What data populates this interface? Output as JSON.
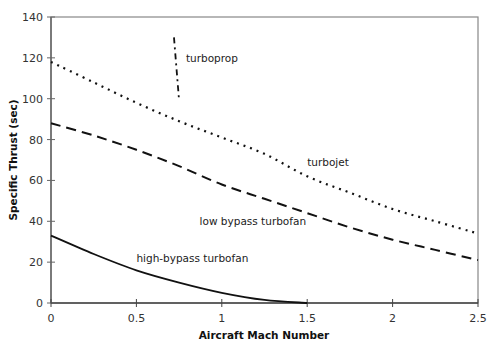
{
  "chart_data": {
    "type": "line",
    "title": "",
    "xlabel": "Aircraft Mach Number",
    "ylabel": "Specific Thrust (sec)",
    "xlim": [
      0,
      2.5
    ],
    "ylim": [
      0,
      140
    ],
    "xticks": [
      0,
      0.5,
      1,
      1.5,
      2,
      2.5
    ],
    "xtick_labels": [
      "0",
      "0.5",
      "1",
      "1.5",
      "2",
      "2.5"
    ],
    "yticks": [
      0,
      20,
      40,
      60,
      80,
      100,
      120,
      140
    ],
    "ytick_labels": [
      "0",
      "20",
      "40",
      "60",
      "80",
      "100",
      "120",
      "140"
    ],
    "grid": false,
    "legend": "none (inline labels)",
    "series": [
      {
        "name": "turboprop",
        "style": "dash-dot",
        "x": [
          0.72,
          0.75
        ],
        "y": [
          130,
          99
        ],
        "label_pos": [
          0.79,
          118
        ]
      },
      {
        "name": "turbojet",
        "style": "dotted",
        "x": [
          0,
          0.25,
          0.5,
          0.75,
          1.0,
          1.25,
          1.5,
          1.75,
          2.0,
          2.25,
          2.5
        ],
        "y": [
          118,
          108,
          98,
          89,
          81,
          73,
          62,
          54,
          46,
          40,
          34
        ],
        "label_pos": [
          1.5,
          67
        ]
      },
      {
        "name": "low bypass turbofan",
        "style": "dashed",
        "x": [
          0,
          0.25,
          0.5,
          0.75,
          1.0,
          1.25,
          1.5,
          1.75,
          2.0,
          2.25,
          2.5
        ],
        "y": [
          88,
          82,
          75,
          67,
          58,
          51,
          44,
          37,
          31,
          26,
          21
        ],
        "label_pos": [
          0.87,
          38
        ]
      },
      {
        "name": "high-bypass turbofan",
        "style": "solid",
        "x": [
          0,
          0.25,
          0.5,
          0.75,
          1.0,
          1.25,
          1.5
        ],
        "y": [
          33,
          24,
          16,
          10,
          5,
          1.5,
          0
        ],
        "label_pos": [
          0.5,
          20
        ]
      }
    ]
  }
}
